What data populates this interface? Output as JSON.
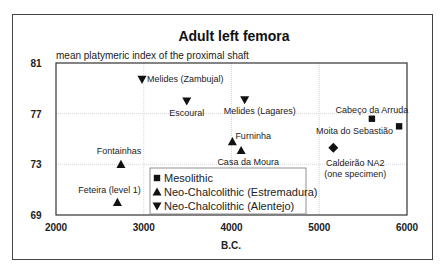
{
  "chart_data": {
    "type": "scatter",
    "title": "Adult left femora",
    "subtitle": "mean platymeric index of the proximal shaft",
    "xlabel": "B.C.",
    "ylabel": "",
    "xlim": [
      2000,
      6000
    ],
    "ylim": [
      69,
      81
    ],
    "xticks": [
      2000,
      3000,
      4000,
      5000,
      6000
    ],
    "yticks": [
      69,
      73,
      77,
      81
    ],
    "grid": true,
    "legend_position": "bottom-center",
    "legend": [
      {
        "name": "Mesolithic",
        "marker": "square"
      },
      {
        "name": "Neo-Chalcolithic (Estremadura)",
        "marker": "triangle-up"
      },
      {
        "name": "Neo-Chalcolithic (Alentejo)",
        "marker": "triangle-down"
      }
    ],
    "series": [
      {
        "name": "Mesolithic",
        "marker": "square",
        "points": [
          {
            "label": "Cabeço da Arruda",
            "x": 5600,
            "y": 76.6
          },
          {
            "label": "Moita do Sebastião",
            "x": 5910,
            "y": 76.0
          }
        ]
      },
      {
        "name": "Neo-Chalcolithic (Estremadura)",
        "marker": "triangle-up",
        "points": [
          {
            "label": "Fontainhas",
            "x": 2740,
            "y": 73.0
          },
          {
            "label": "Feteira (level 1)",
            "x": 2700,
            "y": 70.0
          },
          {
            "label": "Furninha",
            "x": 4010,
            "y": 74.8
          },
          {
            "label": "Casa da Moura",
            "x": 4110,
            "y": 74.1
          }
        ]
      },
      {
        "name": "Neo-Chalcolithic (Alentejo)",
        "marker": "triangle-down",
        "points": [
          {
            "label": "Melides (Zambujal)",
            "x": 2980,
            "y": 79.7
          },
          {
            "label": "Escoural",
            "x": 3490,
            "y": 78.0
          },
          {
            "label": "Melides (Lagares)",
            "x": 4150,
            "y": 78.1
          }
        ]
      },
      {
        "name": "Caldeirão NA2",
        "marker": "diamond",
        "points": [
          {
            "label": "Caldeirão NA2",
            "label2": "(one specimen)",
            "x": 5160,
            "y": 74.3
          }
        ]
      }
    ]
  }
}
